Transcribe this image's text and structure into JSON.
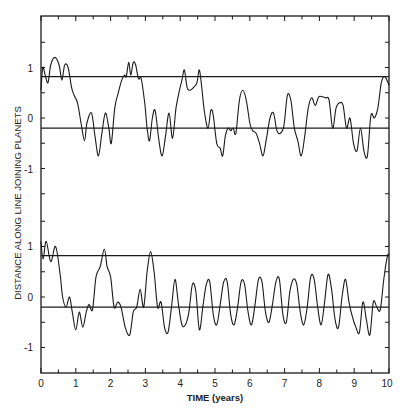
{
  "chart_data": {
    "type": "line",
    "title": "",
    "xlabel": "TIME (years)",
    "ylabel": "DISTANCE ALONG LINE JOINING PLANETS",
    "xlim": [
      0,
      10
    ],
    "x_ticks": [
      "0",
      "1",
      "2",
      "3",
      "4",
      "5",
      "6",
      "7",
      "8",
      "9",
      "10"
    ],
    "grid": false,
    "legend": null,
    "panels": [
      {
        "name": "top",
        "ylim": [
          -1.5,
          1.95
        ],
        "y_ticks": [
          "1",
          "0",
          "-1"
        ],
        "reference_lines": [
          0.82,
          -0.2
        ],
        "series": [
          {
            "name": "top-curve",
            "x": [
              0,
              0.05,
              0.12,
              0.2,
              0.28,
              0.4,
              0.52,
              0.6,
              0.68,
              0.78,
              0.88,
              0.95,
              1.05,
              1.15,
              1.25,
              1.32,
              1.45,
              1.55,
              1.65,
              1.75,
              1.85,
              1.95,
              2.02,
              2.12,
              2.22,
              2.32,
              2.4,
              2.45,
              2.52,
              2.58,
              2.65,
              2.72,
              2.8,
              2.88,
              2.98,
              3.05,
              3.12,
              3.2,
              3.28,
              3.38,
              3.48,
              3.58,
              3.68,
              3.78,
              3.88,
              3.98,
              4.05,
              4.12,
              4.2,
              4.28,
              4.38,
              4.48,
              4.55,
              4.62,
              4.7,
              4.8,
              4.88,
              4.95,
              5.05,
              5.15,
              5.22,
              5.3,
              5.38,
              5.45,
              5.52,
              5.6,
              5.7,
              5.8,
              5.9,
              6.0,
              6.08,
              6.18,
              6.28,
              6.38,
              6.48,
              6.58,
              6.68,
              6.78,
              6.88,
              6.98,
              7.08,
              7.18,
              7.28,
              7.38,
              7.48,
              7.58,
              7.68,
              7.78,
              7.88,
              7.98,
              8.08,
              8.18,
              8.28,
              8.38,
              8.48,
              8.58,
              8.68,
              8.78,
              8.88,
              8.98,
              9.08,
              9.18,
              9.28,
              9.38,
              9.48,
              9.58,
              9.68,
              9.78,
              9.88,
              10.0
            ],
            "y": [
              0.55,
              1.0,
              0.85,
              0.7,
              1.05,
              1.2,
              1.05,
              0.75,
              1.05,
              1.0,
              0.6,
              0.45,
              0.3,
              -0.1,
              -0.45,
              -0.1,
              0.1,
              -0.35,
              -0.75,
              -0.3,
              0.1,
              -0.2,
              -0.5,
              0.2,
              0.5,
              0.75,
              0.85,
              0.82,
              1.1,
              0.85,
              1.1,
              1.05,
              0.78,
              0.78,
              0.3,
              -0.2,
              -0.45,
              0.0,
              0.15,
              -0.4,
              -0.75,
              -0.35,
              0.1,
              -0.4,
              0.2,
              0.55,
              0.75,
              0.95,
              0.6,
              0.55,
              0.6,
              0.7,
              0.95,
              0.6,
              0.1,
              -0.2,
              0.15,
              0.05,
              -0.5,
              -0.6,
              -0.75,
              -0.35,
              -0.2,
              -0.25,
              -0.2,
              -0.3,
              0.35,
              0.55,
              0.35,
              -0.1,
              -0.25,
              -0.3,
              -0.5,
              -0.75,
              -0.4,
              0.0,
              0.1,
              -0.25,
              -0.3,
              -0.15,
              0.45,
              0.35,
              -0.2,
              -0.45,
              -0.75,
              -0.35,
              0.2,
              0.4,
              0.25,
              0.42,
              0.42,
              0.4,
              0.35,
              -0.2,
              0.2,
              0.3,
              0.25,
              -0.2,
              0.0,
              -0.5,
              -0.65,
              -0.2,
              -0.65,
              -0.75,
              0.05,
              0.0,
              0.2,
              0.7,
              0.82,
              0.65,
              1.1
            ],
            "color": "#1a1a1a"
          }
        ]
      },
      {
        "name": "bottom",
        "ylim": [
          -1.5,
          1.95
        ],
        "y_ticks": [
          "1",
          "0",
          "-1"
        ],
        "reference_lines": [
          0.82,
          -0.2
        ],
        "series": [
          {
            "name": "bottom-curve",
            "x": [
              0,
              0.06,
              0.15,
              0.28,
              0.42,
              0.55,
              0.62,
              0.72,
              0.82,
              0.9,
              1.0,
              1.1,
              1.2,
              1.3,
              1.38,
              1.48,
              1.58,
              1.7,
              1.82,
              1.9,
              2.0,
              2.1,
              2.2,
              2.3,
              2.42,
              2.55,
              2.65,
              2.75,
              2.85,
              2.95,
              3.05,
              3.15,
              3.25,
              3.35,
              3.45,
              3.55,
              3.65,
              3.75,
              3.85,
              3.95,
              4.05,
              4.15,
              4.25,
              4.35,
              4.45,
              4.55,
              4.65,
              4.75,
              4.85,
              4.95,
              5.05,
              5.15,
              5.25,
              5.35,
              5.45,
              5.55,
              5.65,
              5.75,
              5.85,
              5.95,
              6.05,
              6.15,
              6.25,
              6.35,
              6.45,
              6.55,
              6.65,
              6.75,
              6.85,
              6.95,
              7.05,
              7.15,
              7.25,
              7.35,
              7.45,
              7.55,
              7.65,
              7.75,
              7.85,
              7.95,
              8.05,
              8.15,
              8.25,
              8.35,
              8.45,
              8.55,
              8.65,
              8.75,
              8.85,
              8.95,
              9.05,
              9.15,
              9.25,
              9.35,
              9.45,
              9.55,
              9.65,
              9.75,
              9.85,
              9.95,
              10.0
            ],
            "y": [
              1.1,
              0.75,
              1.1,
              0.7,
              1.0,
              0.45,
              0.0,
              -0.2,
              0.0,
              -0.3,
              -0.65,
              -0.3,
              -0.6,
              -0.3,
              -0.15,
              -0.25,
              0.4,
              0.6,
              0.95,
              0.6,
              0.4,
              -0.2,
              -0.1,
              -0.2,
              -0.6,
              -0.75,
              -0.3,
              -0.2,
              0.15,
              -0.2,
              0.5,
              0.9,
              0.5,
              -0.2,
              -0.1,
              -0.6,
              -0.7,
              -0.2,
              0.35,
              -0.15,
              -0.55,
              -0.55,
              -0.3,
              0.25,
              0.1,
              -0.65,
              -0.2,
              0.25,
              0.3,
              -0.35,
              -0.55,
              -0.15,
              0.3,
              0.3,
              -0.35,
              -0.55,
              -0.2,
              0.3,
              0.25,
              -0.3,
              -0.55,
              -0.15,
              0.35,
              0.3,
              -0.3,
              -0.5,
              -0.15,
              0.3,
              0.35,
              -0.35,
              -0.5,
              0.1,
              0.35,
              0.25,
              -0.3,
              -0.55,
              -0.2,
              0.4,
              0.35,
              -0.2,
              -0.55,
              -0.1,
              0.45,
              0.15,
              -0.45,
              -0.6,
              0.0,
              0.35,
              -0.1,
              -0.4,
              -0.6,
              -0.7,
              -0.1,
              -0.45,
              -0.75,
              -0.1,
              -0.2,
              -0.25,
              0.35,
              0.8,
              0.85
            ],
            "color": "#1a1a1a"
          }
        ]
      }
    ]
  },
  "labels": {
    "xlabel": "TIME (years)",
    "ylabel": "DISTANCE ALONG LINE JOINING PLANETS",
    "x_ticks": [
      "0",
      "1",
      "2",
      "3",
      "4",
      "5",
      "6",
      "7",
      "8",
      "9",
      "10"
    ],
    "top_y_ticks": [
      "1",
      "0",
      "-1"
    ],
    "bottom_y_ticks": [
      "1",
      "0",
      "-1"
    ]
  }
}
